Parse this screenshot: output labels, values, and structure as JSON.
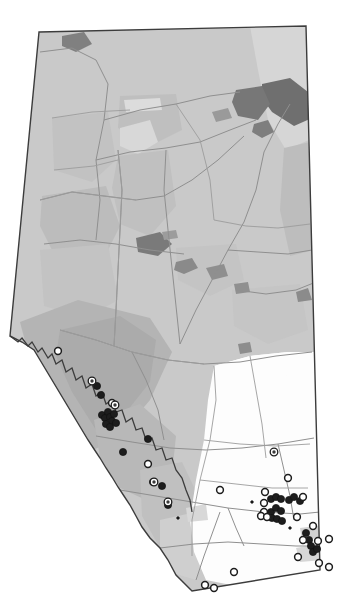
{
  "map": {
    "title": "Alberta distribution map",
    "region_name": "Alberta",
    "country": "Canada",
    "projection_note": "province outline with natural subregion shading",
    "canvas": {
      "width": 346,
      "height": 603
    },
    "colors": {
      "background": "#ffffff",
      "province_base": "#c9c9c9",
      "shade_light": "#d4d4d4",
      "shade_mid": "#bdbdbd",
      "shade_dark": "#b0b0b0",
      "shade_darker": "#a3a3a3",
      "prairie_white": "#fdfdfd",
      "water_dark": "#6f6f6f",
      "water_mid": "#8a8a8a",
      "outline": "#3c3c3c",
      "river_line": "#8f8f8f",
      "subregion_line": "#9a9a9a",
      "marker_filled": "#1d1d1d",
      "marker_hollow_fill": "#ffffff",
      "marker_hollow_stroke": "#1d1d1d"
    },
    "outline_points": "39,32 306,26 320,570 192,591 10,336",
    "legend": {
      "visible": false,
      "entries": [
        {
          "symbol": "filled-circle",
          "label": ""
        },
        {
          "symbol": "hollow-circle",
          "label": ""
        }
      ]
    },
    "labels": [],
    "axis_ticks": [],
    "scale_bar": {
      "visible": false,
      "text": ""
    },
    "north_arrow": {
      "visible": false,
      "text": ""
    }
  },
  "chart_data": {
    "type": "scatter",
    "title": "",
    "xlabel": "",
    "ylabel": "",
    "grid": false,
    "legend_position": "none",
    "xlim": [
      0,
      346
    ],
    "ylim": [
      0,
      603
    ],
    "series": [
      {
        "name": "filled",
        "symbol": "filled-circle",
        "count": 34,
        "points": [
          [
            97,
            386
          ],
          [
            101,
            395
          ],
          [
            102,
            415
          ],
          [
            105,
            418
          ],
          [
            108,
            412
          ],
          [
            110,
            417
          ],
          [
            112,
            421
          ],
          [
            106,
            424
          ],
          [
            110,
            427
          ],
          [
            114,
            414
          ],
          [
            116,
            423
          ],
          [
            148,
            439
          ],
          [
            123,
            452
          ],
          [
            153,
            482
          ],
          [
            162,
            486
          ],
          [
            168,
            505
          ],
          [
            266,
            516
          ],
          [
            271,
            512
          ],
          [
            276,
            508
          ],
          [
            281,
            511
          ],
          [
            272,
            518
          ],
          [
            277,
            519
          ],
          [
            282,
            521
          ],
          [
            271,
            499
          ],
          [
            276,
            497
          ],
          [
            281,
            499
          ],
          [
            289,
            500
          ],
          [
            294,
            497
          ],
          [
            300,
            501
          ],
          [
            306,
            533
          ],
          [
            309,
            540
          ],
          [
            311,
            546
          ],
          [
            313,
            552
          ],
          [
            317,
            549
          ]
        ]
      },
      {
        "name": "hollow",
        "symbol": "hollow-circle",
        "count": 22,
        "points": [
          [
            58,
            351
          ],
          [
            112,
            403
          ],
          [
            148,
            464
          ],
          [
            220,
            490
          ],
          [
            265,
            492
          ],
          [
            264,
            503
          ],
          [
            264,
            512
          ],
          [
            303,
            497
          ],
          [
            261,
            516
          ],
          [
            267,
            517
          ],
          [
            297,
            517
          ],
          [
            313,
            526
          ],
          [
            288,
            478
          ],
          [
            303,
            540
          ],
          [
            318,
            541
          ],
          [
            298,
            557
          ],
          [
            319,
            563
          ],
          [
            234,
            572
          ],
          [
            205,
            585
          ],
          [
            214,
            588
          ],
          [
            329,
            539
          ],
          [
            329,
            567
          ]
        ]
      },
      {
        "name": "target",
        "symbol": "circle-with-dot",
        "count": 5,
        "points": [
          [
            92,
            381
          ],
          [
            115,
            405
          ],
          [
            274,
            452
          ],
          [
            154,
            482
          ],
          [
            168,
            502
          ]
        ]
      },
      {
        "name": "small-dot",
        "symbol": "tiny-dot",
        "count": 3,
        "points": [
          [
            178,
            518
          ],
          [
            290,
            528
          ],
          [
            252,
            502
          ]
        ]
      }
    ]
  }
}
